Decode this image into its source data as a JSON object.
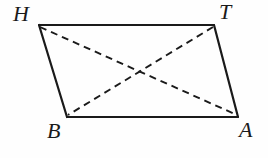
{
  "figure": {
    "kind": "geometry-diagram",
    "shape": "parallelogram",
    "name": "parallelogram-HTAB",
    "background_color": "#fefefe",
    "stroke_color": "#1a1a1a",
    "label_color": "#1a1a1a",
    "canvas": {
      "width": 268,
      "height": 158
    },
    "vertices": [
      {
        "id": "H",
        "label": "H",
        "x": 39,
        "y": 25
      },
      {
        "id": "T",
        "label": "T",
        "x": 214,
        "y": 25
      },
      {
        "id": "A",
        "label": "A",
        "x": 238,
        "y": 117
      },
      {
        "id": "B",
        "label": "B",
        "x": 67,
        "y": 117
      }
    ],
    "label_positions": {
      "H": {
        "x": 13,
        "y": 3
      },
      "T": {
        "x": 219,
        "y": 1
      },
      "B": {
        "x": 47,
        "y": 120
      },
      "A": {
        "x": 239,
        "y": 119
      }
    },
    "sides": [
      {
        "id": "HT",
        "from": "H",
        "to": "T",
        "style": "solid",
        "width": 2.2
      },
      {
        "id": "TA",
        "from": "T",
        "to": "A",
        "style": "solid",
        "width": 2.2
      },
      {
        "id": "AB",
        "from": "A",
        "to": "B",
        "style": "solid",
        "width": 2.2
      },
      {
        "id": "BH",
        "from": "B",
        "to": "H",
        "style": "solid",
        "width": 2.2
      }
    ],
    "diagonals": [
      {
        "id": "HA",
        "from": "H",
        "to": "A",
        "style": "dashed",
        "width": 1.9,
        "dash": "7,5"
      },
      {
        "id": "TB",
        "from": "T",
        "to": "B",
        "style": "dashed",
        "width": 1.9,
        "dash": "7,5"
      }
    ],
    "polygon_points": "39,25 214,25 238,117 67,117"
  }
}
